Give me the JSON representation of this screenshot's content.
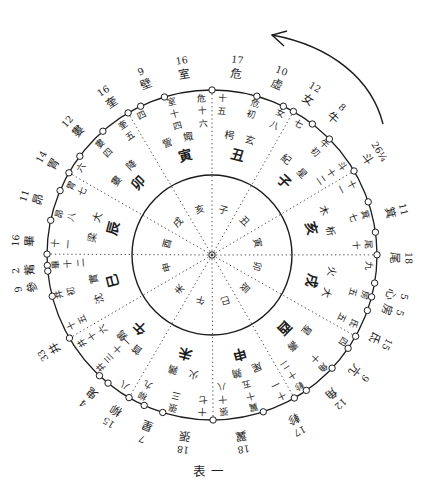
{
  "figure": {
    "caption": "表一",
    "arrow_direction": "counterclockwise"
  },
  "chart": {
    "circle_du": 365.25,
    "top_du": 147.25,
    "mansions": [
      {
        "name": "角",
        "width": "12",
        "start_du": 0
      },
      {
        "name": "亢",
        "width": "9",
        "start_du": 12
      },
      {
        "name": "氐",
        "width": "15",
        "start_du": 21
      },
      {
        "name": "房",
        "width": "5",
        "start_du": 36
      },
      {
        "name": "心",
        "width": "5",
        "start_du": 41
      },
      {
        "name": "尾",
        "width": "18",
        "start_du": 46
      },
      {
        "name": "箕",
        "width": "11",
        "start_du": 64
      },
      {
        "name": "斗",
        "width": "26¼",
        "width_du": 26.25,
        "start_du": 75
      },
      {
        "name": "牛",
        "width": "8",
        "start_du": 101.25
      },
      {
        "name": "女",
        "width": "12",
        "start_du": 109.25
      },
      {
        "name": "虛",
        "width": "10",
        "start_du": 121.25
      },
      {
        "name": "危",
        "width": "17",
        "start_du": 131.25
      },
      {
        "name": "室",
        "width": "16",
        "start_du": 148.25
      },
      {
        "name": "壁",
        "width": "9",
        "start_du": 164.25
      },
      {
        "name": "奎",
        "width": "16",
        "start_du": 173.25
      },
      {
        "name": "婁",
        "width": "12",
        "start_du": 189.25
      },
      {
        "name": "胃",
        "width": "14",
        "start_du": 201.25
      },
      {
        "name": "昴",
        "width": "11",
        "start_du": 215.25
      },
      {
        "name": "畢",
        "width": "16",
        "start_du": 226.25
      },
      {
        "name": "觜",
        "width": "2",
        "start_du": 242.25
      },
      {
        "name": "參",
        "width": "9",
        "start_du": 244.25
      },
      {
        "name": "井",
        "width": "33",
        "start_du": 253.25
      },
      {
        "name": "鬼",
        "width": "4",
        "start_du": 286.25
      },
      {
        "name": "柳",
        "width": "15",
        "start_du": 290.25
      },
      {
        "name": "星",
        "width": "7",
        "start_du": 305.25
      },
      {
        "name": "張",
        "width": "18",
        "start_du": 312.25
      },
      {
        "name": "翼",
        "width": "18",
        "start_du": 330.25
      },
      {
        "name": "軫",
        "width": "17",
        "start_du": 348.25
      }
    ],
    "stations": [
      {
        "name": "星紀",
        "start_du": 87,
        "initial_label": "斗十二",
        "prev_end_label": "十一",
        "mid_label": "牛初",
        "mid_du": 101.25,
        "month_branch": "子",
        "chen_branch": "丑"
      },
      {
        "name": "玄枵",
        "start_du": 117.25,
        "initial_label": "女八",
        "prev_end_label": "七",
        "mid_label": "危初",
        "mid_du": 131.25,
        "month_branch": "丑",
        "chen_branch": "子"
      },
      {
        "name": "娵訾",
        "start_du": 147.25,
        "initial_label": "危十六",
        "prev_end_label": "十五",
        "mid_label": "室十四",
        "mid_du": 162.25,
        "month_branch": "寅",
        "chen_branch": "亥"
      },
      {
        "name": "降婁",
        "start_du": 178.25,
        "initial_label": "奎五",
        "prev_end_label": "四",
        "mid_label": "婁四",
        "mid_du": 193.25,
        "month_branch": "卯",
        "chen_branch": "戌"
      },
      {
        "name": "大梁",
        "start_du": 208.25,
        "initial_label": "胃七",
        "prev_end_label": "六",
        "mid_label": "昴八",
        "mid_du": 223.25,
        "month_branch": "辰",
        "chen_branch": "酉"
      },
      {
        "name": "實沈",
        "start_du": 238.25,
        "initial_label": "畢十二",
        "prev_end_label": "十一",
        "mid_label": "井初",
        "mid_du": 253.25,
        "month_branch": "巳",
        "chen_branch": "申"
      },
      {
        "name": "鶉首",
        "start_du": 269.25,
        "initial_label": "井十六",
        "prev_end_label": "十五",
        "mid_label": "井三十一",
        "mid_du": 284.25,
        "month_branch": "午",
        "chen_branch": "未"
      },
      {
        "name": "鶉火",
        "start_du": 299.25,
        "initial_label": "柳九",
        "prev_end_label": "八",
        "mid_label": "張三",
        "mid_du": 315.25,
        "month_branch": "未",
        "chen_branch": "午"
      },
      {
        "name": "鶉尾",
        "start_du": 330.25,
        "initial_label": "張十八",
        "prev_end_label": "十七",
        "mid_label": "翼十五",
        "mid_du": 345.25,
        "month_branch": "申",
        "chen_branch": "巳"
      },
      {
        "name": "壽星",
        "start_du": 360.25,
        "initial_label": "軫十二",
        "prev_end_label": "十一",
        "mid_label": "角十",
        "mid_du": 375.25,
        "month_branch": "酉",
        "chen_branch": "辰"
      },
      {
        "name": "大火",
        "start_du": 391.25,
        "initial_label": "氐五",
        "prev_end_label": "四",
        "mid_label": "房五",
        "mid_du": 406.25,
        "month_branch": "戌",
        "chen_branch": "卯"
      },
      {
        "name": "析木",
        "start_du": 421.25,
        "initial_label": "尾十",
        "prev_end_label": "九",
        "mid_label": "箕七",
        "mid_du": 436.25,
        "month_branch": "亥",
        "chen_branch": "寅"
      }
    ]
  }
}
